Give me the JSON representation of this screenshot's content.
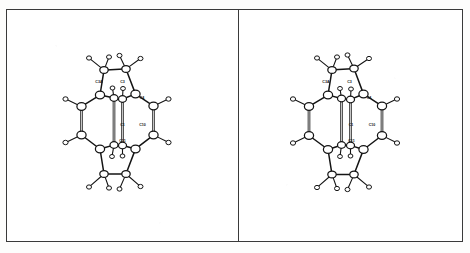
{
  "figure": {
    "domain": "molecular-structure-diagram",
    "style": "ORTEP thermal-ellipsoid ball-and-stick drawing",
    "panel_count": 2,
    "background_color": "#ffffff",
    "line_color": "#141414",
    "frame_color": "#3a3a3a",
    "atom_fill_color": "#ffffff",
    "width_px": 470,
    "height_px": 253
  },
  "panels": [
    {
      "id": "panel-left",
      "name": "left-molecule-panel",
      "caption": "",
      "molecule": {
        "name": "",
        "labels": [
          {
            "text": "C3A",
            "x": 47.0,
            "y": 74.0
          },
          {
            "text": "C3",
            "x": 70.5,
            "y": 74.0
          },
          {
            "text": "C4",
            "x": 90.0,
            "y": 90.0
          },
          {
            "text": "C1",
            "x": 70.5,
            "y": 117.0
          },
          {
            "text": "C10",
            "x": 90.5,
            "y": 117.0
          },
          {
            "text": "C11",
            "x": 70.5,
            "y": 133.0
          }
        ],
        "carbon_atoms": 16,
        "hydrogen_atoms": 16
      }
    },
    {
      "id": "panel-right",
      "name": "right-molecule-panel",
      "caption": "",
      "molecule": {
        "name": "",
        "labels": [
          {
            "text": "C3A",
            "x": 45.0,
            "y": 74.0
          },
          {
            "text": "C3",
            "x": 68.5,
            "y": 74.0
          },
          {
            "text": "C4",
            "x": 88.0,
            "y": 90.0
          },
          {
            "text": "C1",
            "x": 70.0,
            "y": 117.0
          },
          {
            "text": "C10",
            "x": 91.0,
            "y": 117.0
          },
          {
            "text": "C11",
            "x": 70.5,
            "y": 133.0
          }
        ],
        "carbon_atoms": 16,
        "hydrogen_atoms": 16
      }
    }
  ],
  "geometry": {
    "note": "Normalized 0-140 x / 0-233 y coordinate space per panel.",
    "left": {
      "carbons": [
        {
          "id": "C9",
          "x": 52.0,
          "y": 61.0,
          "r": 4.2
        },
        {
          "id": "C3",
          "x": 74.0,
          "y": 60.0,
          "r": 4.2
        },
        {
          "id": "C3A",
          "x": 48.0,
          "y": 86.0,
          "r": 4.6
        },
        {
          "id": "C4",
          "x": 83.5,
          "y": 85.0,
          "r": 4.6
        },
        {
          "id": "C12",
          "x": 62.0,
          "y": 89.0,
          "r": 4.0
        },
        {
          "id": "C13",
          "x": 70.5,
          "y": 90.0,
          "r": 4.0
        },
        {
          "id": "C5",
          "x": 29.5,
          "y": 97.5,
          "r": 4.6
        },
        {
          "id": "C10",
          "x": 101.5,
          "y": 97.0,
          "r": 4.6
        },
        {
          "id": "C6",
          "x": 29.5,
          "y": 126.0,
          "r": 4.6
        },
        {
          "id": "C10A",
          "x": 101.5,
          "y": 126.0,
          "r": 4.6
        },
        {
          "id": "C7",
          "x": 48.0,
          "y": 140.0,
          "r": 4.6
        },
        {
          "id": "C11",
          "x": 83.5,
          "y": 140.0,
          "r": 4.6
        },
        {
          "id": "C14",
          "x": 62.0,
          "y": 136.0,
          "r": 4.0
        },
        {
          "id": "C15",
          "x": 70.5,
          "y": 136.5,
          "r": 4.0
        },
        {
          "id": "C8",
          "x": 52.0,
          "y": 165.0,
          "r": 4.2
        },
        {
          "id": "C16",
          "x": 74.0,
          "y": 165.0,
          "r": 4.2
        }
      ],
      "hydrogens": [
        {
          "x": 37.0,
          "y": 49.0,
          "r": 2.5
        },
        {
          "x": 57.0,
          "y": 48.0,
          "r": 2.5
        },
        {
          "x": 67.5,
          "y": 46.5,
          "r": 2.5
        },
        {
          "x": 88.5,
          "y": 49.5,
          "r": 2.5
        },
        {
          "x": 13.5,
          "y": 90.0,
          "r": 2.6
        },
        {
          "x": 116.5,
          "y": 90.0,
          "r": 2.6
        },
        {
          "x": 60.5,
          "y": 79.0,
          "r": 2.4
        },
        {
          "x": 71.0,
          "y": 79.5,
          "r": 2.4
        },
        {
          "x": 13.5,
          "y": 133.5,
          "r": 2.6
        },
        {
          "x": 116.5,
          "y": 133.5,
          "r": 2.6
        },
        {
          "x": 60.0,
          "y": 147.5,
          "r": 2.4
        },
        {
          "x": 70.5,
          "y": 147.0,
          "r": 2.4
        },
        {
          "x": 37.0,
          "y": 178.0,
          "r": 2.5
        },
        {
          "x": 57.0,
          "y": 179.0,
          "r": 2.5
        },
        {
          "x": 67.5,
          "y": 180.0,
          "r": 2.5
        },
        {
          "x": 88.5,
          "y": 177.5,
          "r": 2.5
        }
      ],
      "bonds": [
        [
          "C9",
          "C3",
          "single"
        ],
        [
          "C9",
          "C3A",
          "single"
        ],
        [
          "C3",
          "C4",
          "single"
        ],
        [
          "C3A",
          "C5",
          "single"
        ],
        [
          "C3A",
          "C12",
          "single"
        ],
        [
          "C4",
          "C10",
          "single"
        ],
        [
          "C4",
          "C13",
          "single"
        ],
        [
          "C5",
          "C6",
          "double"
        ],
        [
          "C10",
          "C10A",
          "double"
        ],
        [
          "C12",
          "C14",
          "double"
        ],
        [
          "C13",
          "C15",
          "double"
        ],
        [
          "C6",
          "C7",
          "single"
        ],
        [
          "C10A",
          "C11",
          "single"
        ],
        [
          "C7",
          "C14",
          "single"
        ],
        [
          "C11",
          "C15",
          "single"
        ],
        [
          "C7",
          "C8",
          "single"
        ],
        [
          "C11",
          "C16",
          "single"
        ],
        [
          "C8",
          "C16",
          "single"
        ]
      ]
    },
    "right": {
      "carbons": [
        {
          "id": "C9",
          "x": 51.0,
          "y": 61.0,
          "r": 4.2
        },
        {
          "id": "C3",
          "x": 73.0,
          "y": 59.5,
          "r": 4.2
        },
        {
          "id": "C3A",
          "x": 47.0,
          "y": 86.0,
          "r": 4.6
        },
        {
          "id": "C4",
          "x": 82.5,
          "y": 85.0,
          "r": 4.6
        },
        {
          "id": "C12",
          "x": 60.5,
          "y": 89.5,
          "r": 4.0
        },
        {
          "id": "C13",
          "x": 69.5,
          "y": 90.5,
          "r": 4.0
        },
        {
          "id": "C5",
          "x": 28.0,
          "y": 97.5,
          "r": 4.6
        },
        {
          "id": "C10",
          "x": 101.0,
          "y": 97.0,
          "r": 4.6
        },
        {
          "id": "C6",
          "x": 28.0,
          "y": 126.5,
          "r": 4.6
        },
        {
          "id": "C10A",
          "x": 101.0,
          "y": 126.5,
          "r": 4.6
        },
        {
          "id": "C7",
          "x": 47.0,
          "y": 140.5,
          "r": 4.6
        },
        {
          "id": "C11",
          "x": 82.5,
          "y": 140.5,
          "r": 4.6
        },
        {
          "id": "C14",
          "x": 60.5,
          "y": 136.0,
          "r": 4.0
        },
        {
          "id": "C15",
          "x": 69.5,
          "y": 136.5,
          "r": 4.0
        },
        {
          "id": "C8",
          "x": 51.0,
          "y": 165.5,
          "r": 4.2
        },
        {
          "id": "C16",
          "x": 73.0,
          "y": 165.5,
          "r": 4.2
        }
      ],
      "hydrogens": [
        {
          "x": 36.0,
          "y": 49.0,
          "r": 2.5
        },
        {
          "x": 56.0,
          "y": 48.0,
          "r": 2.5
        },
        {
          "x": 66.5,
          "y": 46.0,
          "r": 2.5
        },
        {
          "x": 88.0,
          "y": 49.5,
          "r": 2.5
        },
        {
          "x": 12.0,
          "y": 90.0,
          "r": 2.6
        },
        {
          "x": 116.0,
          "y": 90.0,
          "r": 2.6
        },
        {
          "x": 59.0,
          "y": 79.5,
          "r": 2.4
        },
        {
          "x": 70.0,
          "y": 80.0,
          "r": 2.4
        },
        {
          "x": 12.0,
          "y": 134.0,
          "r": 2.6
        },
        {
          "x": 116.0,
          "y": 134.0,
          "r": 2.6
        },
        {
          "x": 59.0,
          "y": 147.5,
          "r": 2.4
        },
        {
          "x": 69.5,
          "y": 147.0,
          "r": 2.4
        },
        {
          "x": 36.0,
          "y": 178.5,
          "r": 2.5
        },
        {
          "x": 56.0,
          "y": 179.5,
          "r": 2.5
        },
        {
          "x": 66.5,
          "y": 180.5,
          "r": 2.5
        },
        {
          "x": 88.0,
          "y": 178.0,
          "r": 2.5
        }
      ],
      "bonds": [
        [
          "C9",
          "C3",
          "single"
        ],
        [
          "C9",
          "C3A",
          "single"
        ],
        [
          "C3",
          "C4",
          "single"
        ],
        [
          "C3A",
          "C5",
          "single"
        ],
        [
          "C3A",
          "C12",
          "single"
        ],
        [
          "C4",
          "C10",
          "single"
        ],
        [
          "C4",
          "C13",
          "single"
        ],
        [
          "C5",
          "C6",
          "double"
        ],
        [
          "C10",
          "C10A",
          "double"
        ],
        [
          "C12",
          "C14",
          "double"
        ],
        [
          "C13",
          "C15",
          "double"
        ],
        [
          "C6",
          "C7",
          "single"
        ],
        [
          "C10A",
          "C11",
          "single"
        ],
        [
          "C7",
          "C14",
          "single"
        ],
        [
          "C11",
          "C15",
          "single"
        ],
        [
          "C7",
          "C8",
          "single"
        ],
        [
          "C11",
          "C16",
          "single"
        ],
        [
          "C8",
          "C16",
          "single"
        ]
      ]
    }
  }
}
